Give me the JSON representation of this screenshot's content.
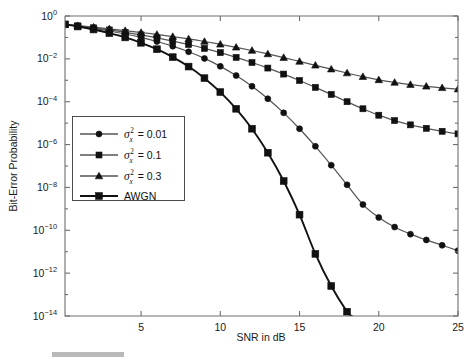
{
  "chart_data": {
    "type": "line",
    "title": "",
    "xlabel": "SNR in dB",
    "ylabel": "Bit-Error Probability",
    "xlim": [
      0.2,
      25
    ],
    "ylim_exp": [
      -14,
      0
    ],
    "yscale": "log",
    "grid": false,
    "legend_position": "center-left",
    "xticks": [
      5,
      10,
      15,
      20,
      25
    ],
    "xtick_labels": [
      "5",
      "10",
      "15",
      "20",
      "25"
    ],
    "yticks_exp": [
      0,
      -2,
      -4,
      -6,
      -8,
      -10,
      -12,
      -14
    ],
    "ytick_labels": [
      "10^0",
      "10^-2",
      "10^-4",
      "10^-6",
      "10^-8",
      "10^-10",
      "10^-12",
      "10^-14"
    ],
    "series": [
      {
        "name": "sigma_x^2 = 0.01",
        "legend_label_prefix": "σ",
        "legend_label_sup": "2",
        "legend_label_sub": "x",
        "legend_label_value": "= 0.01",
        "marker": "circle",
        "color": "#555555",
        "marker_color": "#111111",
        "x": [
          0.2,
          1,
          2,
          3,
          4,
          5,
          6,
          7,
          8,
          9,
          10,
          11,
          12,
          13,
          14,
          15,
          16,
          17,
          18,
          19,
          20,
          21,
          22,
          23,
          24,
          25
        ],
        "y_exp": [
          -0.39,
          -0.47,
          -0.58,
          -0.7,
          -0.84,
          -1.0,
          -1.19,
          -1.41,
          -1.67,
          -1.98,
          -2.35,
          -2.78,
          -3.28,
          -3.86,
          -4.52,
          -5.26,
          -6.08,
          -6.96,
          -7.88,
          -8.8,
          -9.4,
          -9.85,
          -10.18,
          -10.45,
          -10.7,
          -10.95
        ]
      },
      {
        "name": "sigma_x^2 = 0.1",
        "legend_label_prefix": "σ",
        "legend_label_sup": "2",
        "legend_label_sub": "x",
        "legend_label_value": "= 0.1",
        "marker": "square",
        "color": "#555555",
        "marker_color": "#111111",
        "x": [
          0.2,
          1,
          2,
          3,
          4,
          5,
          6,
          7,
          8,
          9,
          10,
          11,
          12,
          13,
          14,
          15,
          16,
          17,
          18,
          19,
          20,
          21,
          22,
          23,
          24,
          25
        ],
        "y_exp": [
          -0.39,
          -0.46,
          -0.55,
          -0.65,
          -0.76,
          -0.88,
          -1.02,
          -1.17,
          -1.33,
          -1.51,
          -1.71,
          -1.93,
          -2.17,
          -2.43,
          -2.71,
          -3.01,
          -3.33,
          -3.66,
          -4.0,
          -4.33,
          -4.63,
          -4.88,
          -5.08,
          -5.24,
          -5.38,
          -5.5
        ]
      },
      {
        "name": "sigma_x^2 = 0.3",
        "legend_label_prefix": "σ",
        "legend_label_sup": "2",
        "legend_label_sub": "x",
        "legend_label_value": "= 0.3",
        "marker": "triangle",
        "color": "#555555",
        "marker_color": "#111111",
        "x": [
          0.2,
          1,
          2,
          3,
          4,
          5,
          6,
          7,
          8,
          9,
          10,
          11,
          12,
          13,
          14,
          15,
          16,
          17,
          18,
          19,
          20,
          21,
          22,
          23,
          24,
          25
        ],
        "y_exp": [
          -0.39,
          -0.45,
          -0.52,
          -0.6,
          -0.68,
          -0.77,
          -0.86,
          -0.96,
          -1.07,
          -1.19,
          -1.32,
          -1.46,
          -1.61,
          -1.77,
          -1.94,
          -2.12,
          -2.3,
          -2.48,
          -2.66,
          -2.83,
          -2.98,
          -3.1,
          -3.2,
          -3.28,
          -3.35,
          -3.41
        ]
      },
      {
        "name": "AWGN",
        "legend_label_prefix": "",
        "legend_label_sup": "",
        "legend_label_sub": "",
        "legend_label_value": "AWGN",
        "marker": "square",
        "color": "#111111",
        "marker_color": "#111111",
        "x": [
          0.2,
          1,
          2,
          3,
          4,
          5,
          6,
          7,
          8,
          9,
          10,
          11,
          12,
          13,
          14,
          15,
          16,
          17,
          18,
          18.3
        ],
        "y_exp": [
          -0.39,
          -0.49,
          -0.63,
          -0.8,
          -1.0,
          -1.25,
          -1.55,
          -1.92,
          -2.36,
          -2.9,
          -3.55,
          -4.33,
          -5.26,
          -6.38,
          -7.7,
          -9.27,
          -11.1,
          -12.6,
          -13.8,
          -14.0
        ]
      }
    ]
  },
  "legend": {
    "entries": [
      {
        "label_value": "= 0.01",
        "marker": "circle"
      },
      {
        "label_value": "= 0.1",
        "marker": "square"
      },
      {
        "label_value": "= 0.3",
        "marker": "triangle"
      },
      {
        "label_value": "AWGN",
        "marker": "square"
      }
    ]
  },
  "colors": {
    "axis": "#6e6e6e",
    "text": "#1a1a1a",
    "curve_gray": "#555555",
    "curve_black": "#111111",
    "background": "#ffffff",
    "artifact": "#b9b9b9"
  }
}
